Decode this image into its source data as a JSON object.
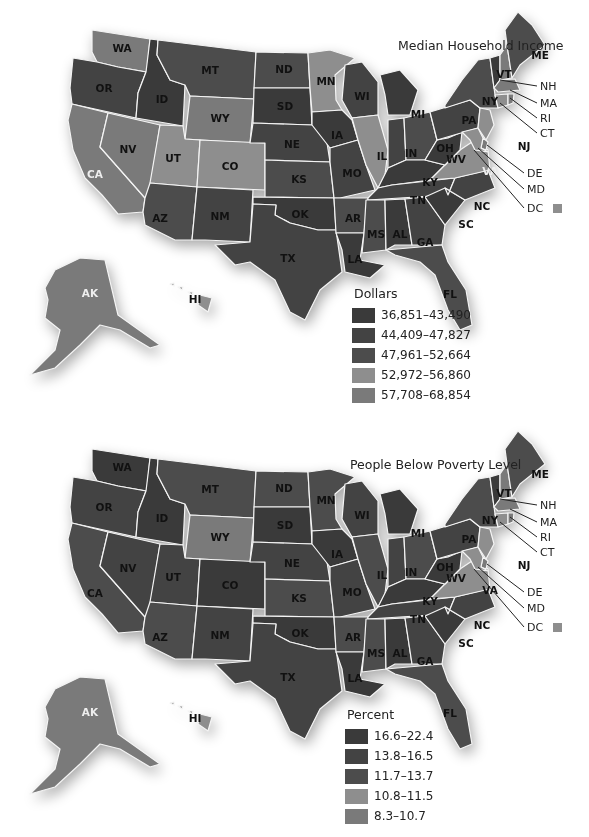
{
  "colors": {
    "dark1": "#3a3a3a",
    "dark2": "#434343",
    "dark3": "#4c4c4c",
    "light1": "#8e8e8e",
    "light2": "#7a7a7a",
    "border": "#f4f4f4",
    "background": "#ffffff"
  },
  "maps": [
    {
      "id": "income",
      "title": "Median Household Income",
      "legend_title": "Dollars",
      "legend": [
        {
          "label": "36,851–43,490",
          "color": "#3a3a3a"
        },
        {
          "label": "44,409–47,827",
          "color": "#434343"
        },
        {
          "label": "47,961–52,664",
          "color": "#4c4c4c"
        },
        {
          "label": "52,972–56,860",
          "color": "#8e8e8e"
        },
        {
          "label": "57,708–68,854",
          "color": "#7a7a7a"
        }
      ],
      "light_states": [
        "WA",
        "CA",
        "NV",
        "UT",
        "CO",
        "WY",
        "MN",
        "IL",
        "VA",
        "AK",
        "HI",
        "NH",
        "MA",
        "RI",
        "CT",
        "NJ",
        "DE",
        "MD",
        "DC"
      ],
      "white_labels": [
        "CA",
        "VA",
        "AK"
      ],
      "callouts": [
        "NH",
        "MA",
        "RI",
        "CT",
        "DE",
        "MD",
        "DC"
      ]
    },
    {
      "id": "poverty",
      "title": "People Below Poverty Level",
      "legend_title": "Percent",
      "legend": [
        {
          "label": "16.6–22.4",
          "color": "#3a3a3a"
        },
        {
          "label": "13.8–16.5",
          "color": "#434343"
        },
        {
          "label": "11.7–13.7",
          "color": "#4c4c4c"
        },
        {
          "label": "10.8–11.5",
          "color": "#8e8e8e"
        },
        {
          "label": "8.3–10.7",
          "color": "#7a7a7a"
        }
      ],
      "light_states": [
        "WY",
        "AK",
        "HI",
        "VA",
        "NH",
        "MA",
        "RI",
        "CT",
        "NJ",
        "DE",
        "MD",
        "DC"
      ],
      "white_labels": [
        "AK"
      ],
      "callouts": [
        "NH",
        "MA",
        "RI",
        "CT",
        "DE",
        "MD",
        "DC"
      ]
    }
  ],
  "state_labels": [
    "WA",
    "OR",
    "CA",
    "ID",
    "NV",
    "MT",
    "WY",
    "UT",
    "AZ",
    "CO",
    "NM",
    "ND",
    "SD",
    "NE",
    "KS",
    "OK",
    "TX",
    "MN",
    "IA",
    "MO",
    "AR",
    "LA",
    "WI",
    "IL",
    "MI",
    "IN",
    "OH",
    "KY",
    "TN",
    "MS",
    "AL",
    "GA",
    "FL",
    "SC",
    "NC",
    "VA",
    "WV",
    "PA",
    "NY",
    "VT",
    "ME",
    "NJ",
    "AK",
    "HI"
  ]
}
